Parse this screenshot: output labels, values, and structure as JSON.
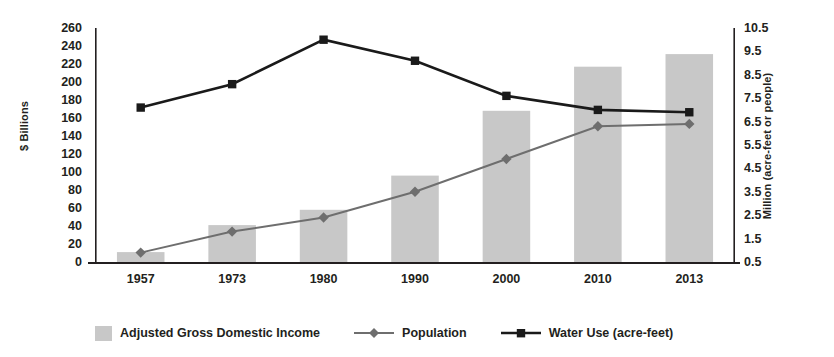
{
  "chart_data": {
    "type": "bar",
    "title": "",
    "subtitle": "",
    "categories": [
      "1957",
      "1973",
      "1980",
      "1990",
      "2000",
      "2010",
      "2013"
    ],
    "xlabel": "",
    "grid": false,
    "legend_position": "bottom",
    "axes": {
      "left": {
        "label": "$ Billions",
        "min": 0,
        "max": 260,
        "step": 20,
        "ticks": [
          260,
          240,
          220,
          200,
          180,
          160,
          140,
          120,
          100,
          80,
          60,
          40,
          20,
          0
        ]
      },
      "right": {
        "label": "Million (acre-feet or people)",
        "min": 0.5,
        "max": 10.5,
        "step": 1.0,
        "ticks": [
          "10.5",
          "9.5",
          "8.5",
          "7.5",
          "6.5",
          "5.5",
          "4.5",
          "3.5",
          "2.5",
          "1.5",
          "0.5"
        ]
      }
    },
    "series": [
      {
        "name": "Adjusted Gross Domestic Income",
        "type": "bar",
        "axis": "left",
        "color": "#c8c8c8",
        "values": [
          11,
          41,
          58,
          96,
          168,
          217,
          231
        ]
      },
      {
        "name": "Population",
        "type": "line",
        "axis": "right",
        "color": "#6e6e6e",
        "marker": "diamond",
        "values": [
          0.9,
          1.8,
          2.4,
          3.5,
          4.9,
          6.3,
          6.4
        ]
      },
      {
        "name": "Water Use (acre-feet)",
        "type": "line",
        "axis": "right",
        "color": "#1a1a1a",
        "marker": "square",
        "values": [
          7.1,
          8.1,
          10.0,
          9.1,
          7.6,
          7.0,
          6.9
        ]
      }
    ]
  },
  "legend": {
    "items": [
      {
        "label": "Adjusted Gross Domestic Income",
        "marker": "bar-swatch"
      },
      {
        "label": "Population",
        "marker": "line-diamond"
      },
      {
        "label": "Water Use (acre-feet)",
        "marker": "line-square"
      }
    ]
  }
}
